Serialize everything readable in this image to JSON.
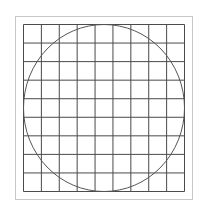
{
  "diagram": {
    "frame": {
      "x": 15.5,
      "y": 16.5,
      "width": 177,
      "height": 183,
      "color": "#c8c8c8"
    },
    "grid": {
      "x": 23.5,
      "y": 24.5,
      "width": 161,
      "height": 167,
      "columns": 9,
      "rows": 9,
      "color": "#4a4a4a"
    },
    "circle": {
      "cx": 104,
      "cy": 108,
      "rx": 80.5,
      "ry": 83.5,
      "color": "#555555"
    }
  }
}
